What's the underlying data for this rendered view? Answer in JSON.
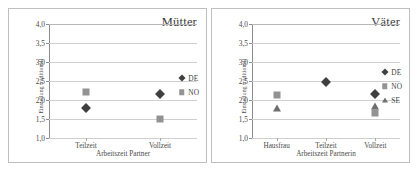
{
  "chart_data": [
    {
      "type": "scatter",
      "title": "Mütter",
      "xlabel": "Arbeitszeit Partner",
      "ylabel": "Einstellung traditionell",
      "categories": [
        "Teilzeit",
        "Vollzeit"
      ],
      "ylim": [
        1.0,
        4.0
      ],
      "yticks": [
        1.0,
        1.5,
        2.0,
        2.5,
        3.0,
        3.5,
        4.0
      ],
      "ytick_labels": [
        "1,0",
        "1,5",
        "2,0",
        "2,5",
        "3,0",
        "3,5",
        "4,0"
      ],
      "grid": true,
      "legend_position": "right",
      "series": [
        {
          "name": "DE",
          "marker": "diamond",
          "color": "#3f3f3f",
          "values": [
            1.78,
            2.17
          ]
        },
        {
          "name": "NO",
          "marker": "square",
          "color": "#939393",
          "values": [
            2.2,
            1.51
          ]
        }
      ]
    },
    {
      "type": "scatter",
      "title": "Väter",
      "xlabel": "Arbeitszeit Partnerin",
      "ylabel": "Einstellung traditionell",
      "categories": [
        "Hausfrau",
        "Teilzeit",
        "Vollzeit"
      ],
      "ylim": [
        1.0,
        4.0
      ],
      "yticks": [
        1.0,
        1.5,
        2.0,
        2.5,
        3.0,
        3.5,
        4.0
      ],
      "ytick_labels": [
        "1,0",
        "1,5",
        "2,0",
        "2,5",
        "3,0",
        "3,5",
        "4,0"
      ],
      "grid": true,
      "legend_position": "right",
      "series": [
        {
          "name": "DE",
          "marker": "diamond",
          "color": "#3f3f3f",
          "values": [
            null,
            2.47,
            2.17
          ]
        },
        {
          "name": "NO",
          "marker": "square",
          "color": "#939393",
          "values": [
            2.12,
            null,
            1.66
          ]
        },
        {
          "name": "SE",
          "marker": "triangle",
          "color": "#6f6f6f",
          "values": [
            1.78,
            null,
            1.85
          ]
        }
      ]
    }
  ]
}
